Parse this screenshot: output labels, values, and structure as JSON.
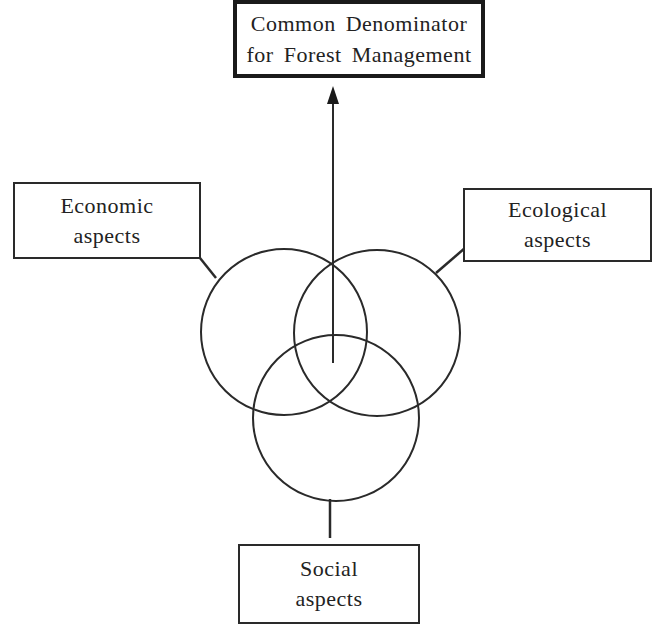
{
  "diagram": {
    "goal": {
      "line1": "Common Denominator",
      "line2": "for Forest Management"
    },
    "economic": {
      "line1": "Economic",
      "line2": "aspects"
    },
    "ecological": {
      "line1": "Ecological",
      "line2": "aspects"
    },
    "social": {
      "line1": "Social",
      "line2": "aspects"
    }
  },
  "colors": {
    "stroke": "#2a2a2a",
    "background": "#ffffff"
  }
}
